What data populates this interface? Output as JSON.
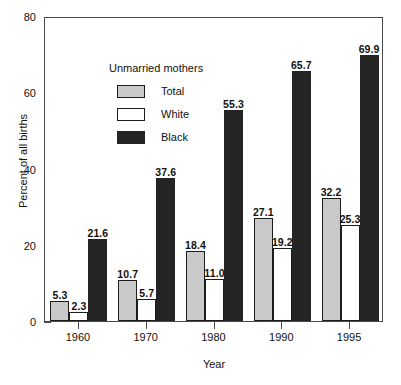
{
  "chart_data": {
    "type": "bar",
    "title": "",
    "xlabel": "Year",
    "ylabel": "Percent of all births",
    "categories": [
      "1960",
      "1970",
      "1980",
      "1990",
      "1995"
    ],
    "series": [
      {
        "name": "Total",
        "color": "#c9c9c9",
        "values": [
          5.3,
          10.7,
          18.4,
          27.1,
          32.2
        ]
      },
      {
        "name": "White",
        "color": "#ffffff",
        "values": [
          2.3,
          5.7,
          11.0,
          19.2,
          25.3
        ]
      },
      {
        "name": "Black",
        "color": "#242424",
        "values": [
          21.6,
          37.6,
          55.3,
          65.7,
          69.9
        ]
      }
    ],
    "ylim": [
      0,
      80
    ],
    "yticks": [
      0,
      20,
      40,
      60,
      80
    ],
    "ytick_labels": [
      "0",
      "20",
      "40",
      "60",
      "80"
    ],
    "grid": false,
    "legend_position": "upper-left-inside",
    "legend_title": "Unmarried mothers",
    "data_labels": [
      [
        "5.3",
        "2.3",
        "21.6"
      ],
      [
        "10.7",
        "5.7",
        "37.6"
      ],
      [
        "18.4",
        "11.0",
        "55.3"
      ],
      [
        "27.1",
        "19.2",
        "65.7"
      ],
      [
        "32.2",
        "25.3",
        "69.9"
      ]
    ]
  }
}
